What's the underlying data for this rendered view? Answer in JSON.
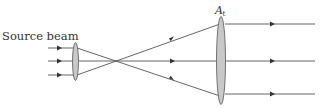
{
  "labels": {
    "source_beam": "Source beam",
    "aperture_main": "A",
    "aperture_sub": "t"
  },
  "colors": {
    "ray": "#555555",
    "lens_fill": "#c8c8c8",
    "lens_stroke": "#555555",
    "text": "#333333"
  },
  "elements": {
    "source_lens": {
      "cx": 75.5,
      "cy": 61.5,
      "rx": 3,
      "ry": 19
    },
    "target_lens": {
      "cx": 221,
      "cy": 60.5,
      "rx": 4.5,
      "ry": 44
    },
    "focus_point": {
      "x": 116,
      "y": 61
    },
    "input_rays_y": [
      48,
      61,
      75
    ],
    "output_rays_y": [
      24,
      61,
      94
    ]
  }
}
